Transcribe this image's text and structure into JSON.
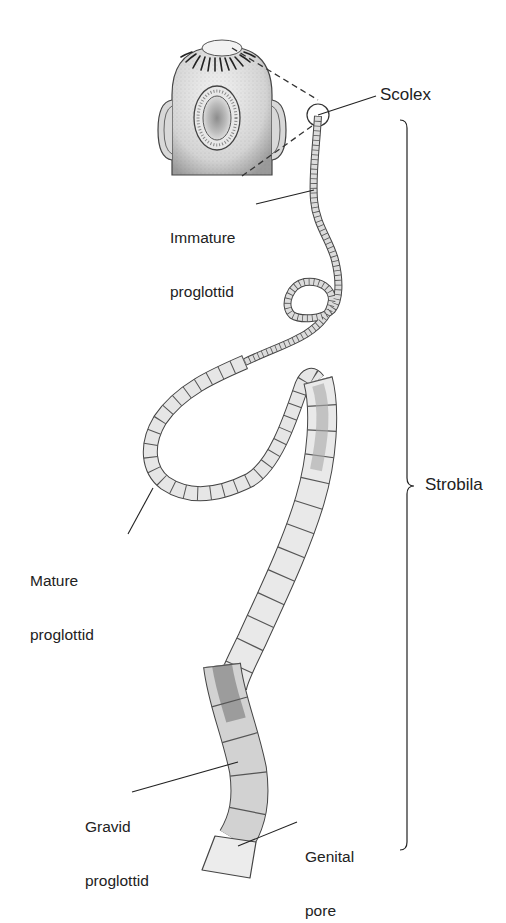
{
  "diagram": {
    "labels": {
      "scolex": "Scolex",
      "immature_line1": "Immature",
      "immature_line2": "proglottid",
      "mature_line1": "Mature",
      "mature_line2": "proglottid",
      "gravid_line1": "Gravid",
      "gravid_line2": "proglottid",
      "genital_line1": "Genital",
      "genital_line2": "pore",
      "strobila": "Strobila"
    },
    "colors": {
      "outline": "#333333",
      "segment_light": "#e8e8e8",
      "segment_mid": "#c8c8c8",
      "segment_dark": "#8a8a8a",
      "text": "#222222",
      "background": "#ffffff"
    }
  }
}
